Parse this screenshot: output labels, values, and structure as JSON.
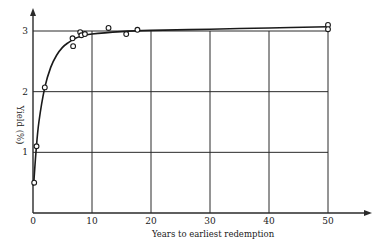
{
  "chart_data": {
    "type": "scatter",
    "title": "",
    "xlabel": "Years to earliest redemption",
    "ylabel": "Yield (%)",
    "xlim": [
      0,
      50
    ],
    "ylim": [
      0,
      3
    ],
    "xticks": [
      0,
      10,
      20,
      30,
      40,
      50
    ],
    "yticks": [
      1,
      2,
      3
    ],
    "xtick_labels": [
      "0",
      "10",
      "20",
      "30",
      "40",
      "50"
    ],
    "ytick_labels": [
      "1",
      "2",
      "3"
    ],
    "grid": true,
    "legend": null,
    "series": [
      {
        "name": "Observed yields",
        "marker": "open-circle",
        "points": [
          {
            "x": 0.2,
            "y": 0.5
          },
          {
            "x": 0.6,
            "y": 1.1
          },
          {
            "x": 2.0,
            "y": 2.07
          },
          {
            "x": 6.7,
            "y": 2.88
          },
          {
            "x": 6.8,
            "y": 2.75
          },
          {
            "x": 8.0,
            "y": 2.98
          },
          {
            "x": 8.2,
            "y": 2.93
          },
          {
            "x": 8.8,
            "y": 2.95
          },
          {
            "x": 12.8,
            "y": 3.05
          },
          {
            "x": 15.8,
            "y": 2.95
          },
          {
            "x": 17.7,
            "y": 3.02
          },
          {
            "x": 50.0,
            "y": 3.1
          },
          {
            "x": 50.0,
            "y": 3.03
          }
        ]
      },
      {
        "name": "Fitted yield curve",
        "type": "line",
        "points": [
          {
            "x": 0.1,
            "y": 0.45
          },
          {
            "x": 0.5,
            "y": 1.0
          },
          {
            "x": 1.0,
            "y": 1.5
          },
          {
            "x": 2.0,
            "y": 2.07
          },
          {
            "x": 3.0,
            "y": 2.4
          },
          {
            "x": 4.0,
            "y": 2.6
          },
          {
            "x": 5.0,
            "y": 2.73
          },
          {
            "x": 6.0,
            "y": 2.81
          },
          {
            "x": 7.0,
            "y": 2.87
          },
          {
            "x": 8.0,
            "y": 2.91
          },
          {
            "x": 10.0,
            "y": 2.95
          },
          {
            "x": 15.0,
            "y": 2.99
          },
          {
            "x": 20.0,
            "y": 3.01
          },
          {
            "x": 30.0,
            "y": 3.03
          },
          {
            "x": 40.0,
            "y": 3.05
          },
          {
            "x": 50.0,
            "y": 3.07
          }
        ]
      }
    ]
  }
}
